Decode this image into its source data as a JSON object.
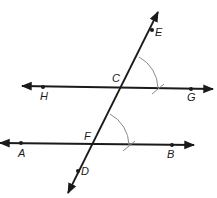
{
  "diagram": {
    "colors": {
      "line": "#1a1a1a",
      "arc": "#8a8a8a",
      "background": "#ffffff"
    },
    "lines": [
      {
        "id": "line-HG",
        "name": "line HG",
        "from": [
          22,
          86
        ],
        "to": [
          213,
          89
        ],
        "arrows": "both"
      },
      {
        "id": "line-AB",
        "name": "line AB",
        "from": [
          0,
          143
        ],
        "to": [
          194,
          145
        ],
        "arrows": "both"
      },
      {
        "id": "transversal-ED",
        "name": "line ED",
        "from": [
          158,
          12
        ],
        "to": [
          68,
          193
        ],
        "arrows": "both"
      }
    ],
    "points": [
      {
        "label": "E",
        "x": 152,
        "y": 30,
        "label_x": 155,
        "label_y": 36
      },
      {
        "label": "C",
        "x": 121,
        "y": 87,
        "label_x": 112,
        "label_y": 82
      },
      {
        "label": "H",
        "x": 43,
        "y": 87,
        "label_x": 40,
        "label_y": 100
      },
      {
        "label": "G",
        "x": 191,
        "y": 89,
        "label_x": 187,
        "label_y": 101
      },
      {
        "label": "F",
        "x": 92,
        "y": 144,
        "label_x": 84,
        "label_y": 140
      },
      {
        "label": "A",
        "x": 21,
        "y": 143,
        "label_x": 18,
        "label_y": 157
      },
      {
        "label": "B",
        "x": 172,
        "y": 145,
        "label_x": 167,
        "label_y": 158
      },
      {
        "label": "D",
        "x": 78,
        "y": 171,
        "label_x": 81,
        "label_y": 175
      }
    ],
    "arcs": [
      {
        "id": "arc-at-C",
        "center": "C",
        "path": "M 139 57 A 36 36 0 0 1 158 88"
      },
      {
        "id": "arc-at-F",
        "center": "F",
        "path": "M 110 114 A 36 36 0 0 1 129 145"
      }
    ],
    "arc_ticks": [
      {
        "id": "tick-C",
        "path": "M 152 94 L 164 84"
      },
      {
        "id": "tick-F",
        "path": "M 123 151 L 135 141"
      }
    ]
  }
}
